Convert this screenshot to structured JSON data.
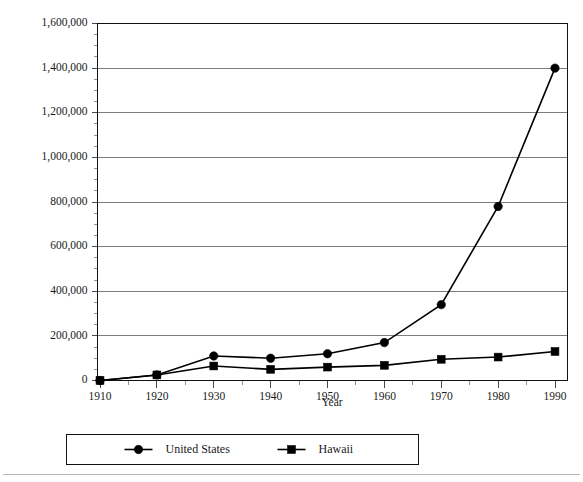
{
  "chart_data": {
    "type": "line",
    "title": "",
    "subtitle": "",
    "xlabel": "Year",
    "ylabel": "",
    "x": [
      1910,
      1920,
      1930,
      1940,
      1950,
      1960,
      1970,
      1980,
      1990
    ],
    "xtick_labels": [
      "1910",
      "1920",
      "1930",
      "1940",
      "1950",
      "1960",
      "1970",
      "1980",
      "1990"
    ],
    "ytick_labels": [
      "0",
      "200,000",
      "400,000",
      "600,000",
      "800,000",
      "1,000,000",
      "1,200,000",
      "1,400,000",
      "1,600,000"
    ],
    "ytick_values": [
      0,
      200000,
      400000,
      600000,
      800000,
      1000000,
      1200000,
      1400000,
      1600000
    ],
    "ylim": [
      0,
      1600000
    ],
    "xlim": [
      1905,
      1995
    ],
    "grid": "horizontal",
    "minor_ticks_y": 4,
    "legend_position": "bottom",
    "series": [
      {
        "name": "United States",
        "marker": "circle",
        "color": "#000000",
        "values": [
          0,
          25000,
          110000,
          100000,
          120000,
          170000,
          340000,
          780000,
          1400000
        ]
      },
      {
        "name": "Hawaii",
        "marker": "square",
        "color": "#000000",
        "values": [
          0,
          25000,
          65000,
          50000,
          60000,
          68000,
          95000,
          105000,
          130000
        ]
      }
    ]
  },
  "legend": {
    "entries": [
      {
        "label": "United States",
        "marker": "circle"
      },
      {
        "label": "Hawaii",
        "marker": "square"
      }
    ]
  },
  "axes": {
    "x_title": "Year"
  }
}
